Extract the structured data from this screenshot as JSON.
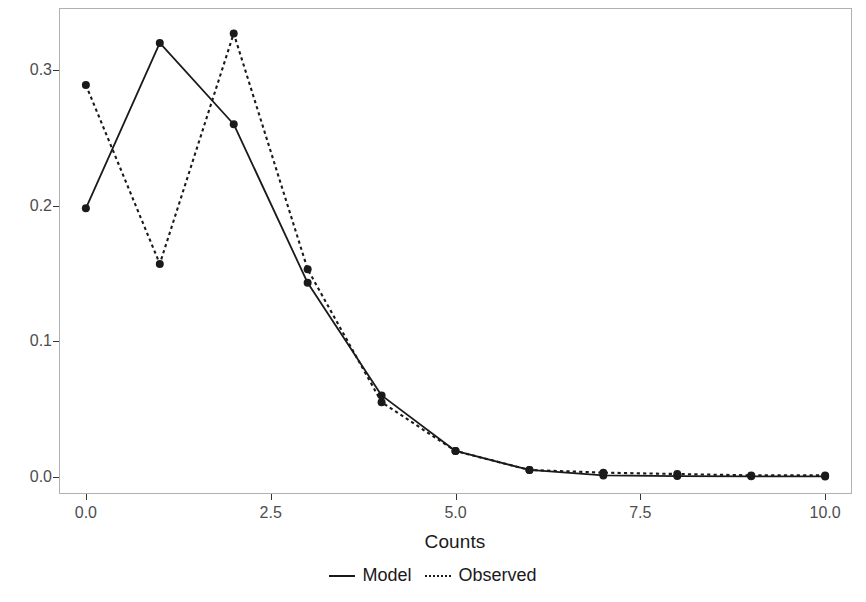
{
  "chart_data": {
    "type": "line",
    "title": "",
    "xlabel": "Counts",
    "ylabel": "Predicted Probability",
    "x": [
      0,
      1,
      2,
      3,
      4,
      5,
      6,
      7,
      8,
      9,
      10
    ],
    "xlim": [
      -0.35,
      10.35
    ],
    "ylim": [
      -0.012,
      0.345
    ],
    "xticks": [
      0.0,
      2.5,
      5.0,
      7.5,
      10.0
    ],
    "xticklabels": [
      "0.0",
      "2.5",
      "5.0",
      "7.5",
      "10.0"
    ],
    "yticks": [
      0.0,
      0.1,
      0.2,
      0.3
    ],
    "yticklabels": [
      "0.0",
      "0.1",
      "0.2",
      "0.3"
    ],
    "grid": false,
    "legend_position": "bottom",
    "series": [
      {
        "name": "Model",
        "linestyle": "solid",
        "color": "#1a1a1a",
        "marker": "circle",
        "values": [
          0.198,
          0.32,
          0.26,
          0.143,
          0.06,
          0.019,
          0.005,
          0.001,
          0.0005,
          0.0003,
          0.0002
        ]
      },
      {
        "name": "Observed",
        "linestyle": "dotted",
        "color": "#1a1a1a",
        "marker": "circle",
        "values": [
          0.289,
          0.157,
          0.327,
          0.153,
          0.055,
          0.019,
          0.005,
          0.003,
          0.002,
          0.001,
          0.001
        ]
      }
    ]
  },
  "legend": {
    "entries": [
      {
        "label": "Model",
        "key": "solid-line-key"
      },
      {
        "label": "Observed",
        "key": "dotted-line-key"
      }
    ]
  },
  "axes": {
    "x_title": "Counts",
    "y_title": "Predicted Probability"
  }
}
